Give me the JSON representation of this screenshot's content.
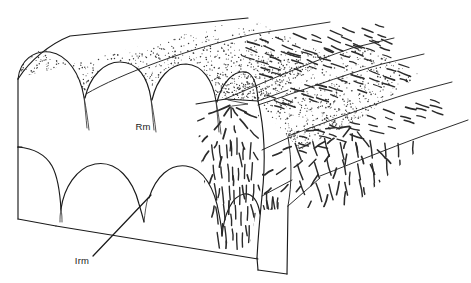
{
  "figure": {
    "background_color": "#ffffff",
    "line_color": "#1b1b1b",
    "stipple_color": "#3c3c3c",
    "fiber_color": "#2b2b2b",
    "width": 471,
    "height": 283
  },
  "labels": [
    {
      "id": "rm",
      "text": "Rm",
      "x": 143,
      "y": 130,
      "has_leader": false,
      "description": "radial muscle label placed on front arched face"
    },
    {
      "id": "irm",
      "text": "Irm",
      "x": 82,
      "y": 264,
      "has_leader": true,
      "leader": {
        "x1": 93,
        "y1": 256,
        "x2": 151,
        "y2": 195
      },
      "description": "inner radial muscle label with leader line to lower arch cusp"
    }
  ],
  "structures": {
    "front_face": {
      "name": "front arched face",
      "upper_arch_count": 3,
      "lower_arch_count": 3
    },
    "top_surface": {
      "name": "stippled dorsal surface",
      "shading": "stipple"
    },
    "cut_face": {
      "name": "cut-away face with radiating fiber bundles",
      "fiber_pattern": "radiating dashed fibers"
    },
    "right_surface": {
      "name": "right longitudinal surface with dashed fiber rows",
      "fiber_pattern": "oblique dashes"
    }
  }
}
